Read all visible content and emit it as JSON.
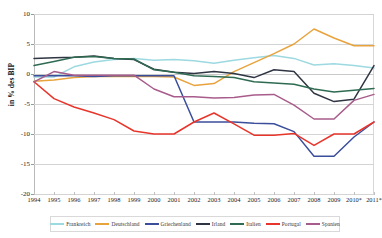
{
  "chart_data": {
    "type": "line",
    "title": "",
    "xlabel": "",
    "ylabel": "in % des BIP",
    "ylim": [
      -20,
      10
    ],
    "yticks": [
      10,
      5,
      0,
      -5,
      -10,
      -15,
      -20
    ],
    "ytick_labels": [
      "10",
      "5",
      "0",
      "-5",
      "-10",
      "-15",
      "-20"
    ],
    "grid": true,
    "legend_position": "bottom",
    "categories": [
      "1994",
      "1995",
      "1996",
      "1997",
      "1998",
      "1999",
      "2000",
      "2001",
      "2002",
      "2003",
      "2004",
      "2005",
      "2006",
      "2007",
      "2008",
      "2009",
      "2010*",
      "2011*"
    ],
    "x": [
      1994,
      1995,
      1996,
      1997,
      1998,
      1999,
      2000,
      2001,
      2002,
      2003,
      2004,
      2005,
      2006,
      2007,
      2008,
      2009,
      2010,
      2011
    ],
    "series": [
      {
        "name": "Frankreich",
        "color": "#9DD9E0",
        "values": [
          -0.5,
          -0.5,
          1.2,
          2.0,
          2.4,
          2.6,
          2.3,
          2.4,
          2.2,
          1.8,
          2.3,
          2.7,
          3.1,
          2.6,
          1.5,
          1.7,
          1.4,
          1.0
        ]
      },
      {
        "name": "Deutschland",
        "color": "#E8A33D",
        "values": [
          -1.2,
          -1.0,
          -0.6,
          -0.4,
          -0.4,
          -0.4,
          -0.4,
          -0.5,
          -1.9,
          -1.6,
          0.4,
          1.9,
          3.4,
          5.0,
          7.5,
          6.0,
          4.7,
          4.7
        ]
      },
      {
        "name": "Griechenland",
        "color": "#3B4E9C",
        "values": [
          -0.3,
          -0.3,
          -0.3,
          -0.4,
          -0.3,
          -0.3,
          -0.3,
          -0.3,
          -8.0,
          -8.0,
          -8.0,
          -8.2,
          -8.3,
          -9.6,
          -13.7,
          -13.7,
          -10.5,
          -8.0
        ]
      },
      {
        "name": "Irland",
        "color": "#2F3542",
        "values": [
          2.6,
          2.7,
          2.8,
          3.0,
          2.6,
          2.4,
          0.8,
          0.3,
          0.1,
          0.4,
          0.1,
          -0.6,
          0.7,
          0.4,
          -3.2,
          -4.6,
          -4.2,
          1.4
        ]
      },
      {
        "name": "Italien",
        "color": "#2F6B52",
        "values": [
          1.4,
          2.1,
          2.8,
          2.9,
          2.6,
          2.5,
          0.7,
          0.3,
          -0.3,
          -0.4,
          -0.6,
          -1.3,
          -1.5,
          -1.7,
          -2.5,
          -3.0,
          -2.7,
          -2.4
        ]
      },
      {
        "name": "Portugal",
        "color": "#E8352B",
        "values": [
          -1.3,
          -4.1,
          -5.5,
          -6.5,
          -7.6,
          -9.5,
          -10.0,
          -10.0,
          -8.0,
          -6.5,
          -8.3,
          -10.2,
          -10.2,
          -9.9,
          -11.9,
          -10.0,
          -10.0,
          -8.0
        ]
      },
      {
        "name": "Spanien",
        "color": "#A85C8B",
        "values": [
          -1.3,
          0.4,
          -0.2,
          -0.2,
          -0.2,
          -0.2,
          -2.5,
          -3.8,
          -3.8,
          -4.0,
          -3.9,
          -3.5,
          -3.4,
          -5.2,
          -7.5,
          -7.5,
          -4.4,
          -3.4
        ]
      }
    ]
  },
  "legend": {
    "items": [
      {
        "label": "Frankreich",
        "color": "#9DD9E0"
      },
      {
        "label": "Deutschland",
        "color": "#E8A33D"
      },
      {
        "label": "Griechenland",
        "color": "#3B4E9C"
      },
      {
        "label": "Irland",
        "color": "#2F3542"
      },
      {
        "label": "Italien",
        "color": "#2F6B52"
      },
      {
        "label": "Portugal",
        "color": "#E8352B"
      },
      {
        "label": "Spanien",
        "color": "#A85C8B"
      }
    ]
  }
}
